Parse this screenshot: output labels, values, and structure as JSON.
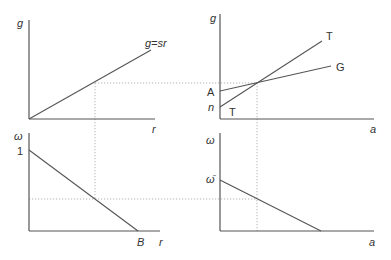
{
  "panels": {
    "top_left": {
      "y_label": "g",
      "x_label": "r",
      "curve_label": "g=sr"
    },
    "top_right": {
      "y_label": "g",
      "x_label": "a",
      "curve_T_label": "T",
      "curve_T_start_label": "T",
      "curve_G_label": "G",
      "intercept_A": "A",
      "intercept_n": "n"
    },
    "bottom_left": {
      "y_label": "ω",
      "x_label": "r",
      "y_intercept": "1",
      "x_intercept": "B"
    },
    "bottom_right": {
      "y_label": "ω",
      "x_label": "a",
      "y_intercept": "ω̄"
    }
  },
  "colors": {
    "lines": "#555555",
    "guides": "#aaaaaa",
    "text": "#333333"
  }
}
